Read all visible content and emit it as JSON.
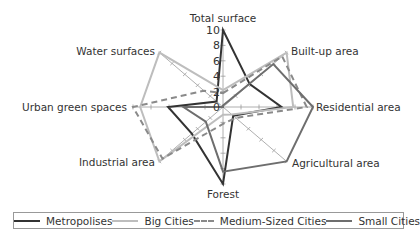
{
  "chart_data": {
    "type": "radar",
    "title": "",
    "axes": [
      "Total surface",
      "Built-up area",
      "Residential area",
      "Agricultural area",
      "Forest",
      "Industrial area",
      "Urban green spaces",
      "Water surfaces"
    ],
    "range": [
      0,
      10
    ],
    "ticks": [
      "0",
      "2",
      "4",
      "6",
      "8",
      "10"
    ],
    "series": [
      {
        "name": "Metropolises",
        "color": "#333333",
        "dash": "",
        "values": [
          10,
          4.2,
          6.5,
          1.6,
          10,
          4.9,
          6.1,
          1.0
        ]
      },
      {
        "name": "Big Cities",
        "color": "#bdbdbd",
        "dash": "",
        "values": [
          2.2,
          10,
          7.8,
          1.4,
          1.0,
          10,
          9.2,
          10
        ]
      },
      {
        "name": "Medium-Sized Cities",
        "color": "#8a8a8a",
        "dash": "6,4",
        "values": [
          1.8,
          9.3,
          9.3,
          2.0,
          2.2,
          9.5,
          10,
          3.0
        ]
      },
      {
        "name": "Small Cities",
        "color": "#6e6e6e",
        "dash": "",
        "values": [
          0.2,
          7.9,
          10,
          10,
          8.4,
          2.7,
          4.4,
          0.0
        ]
      }
    ],
    "legend_position": "bottom"
  },
  "legend": {
    "items": [
      {
        "label": "Metropolises"
      },
      {
        "label": "Big Cities"
      },
      {
        "label": "Medium-Sized Cities"
      },
      {
        "label": "Small Cities"
      }
    ]
  }
}
